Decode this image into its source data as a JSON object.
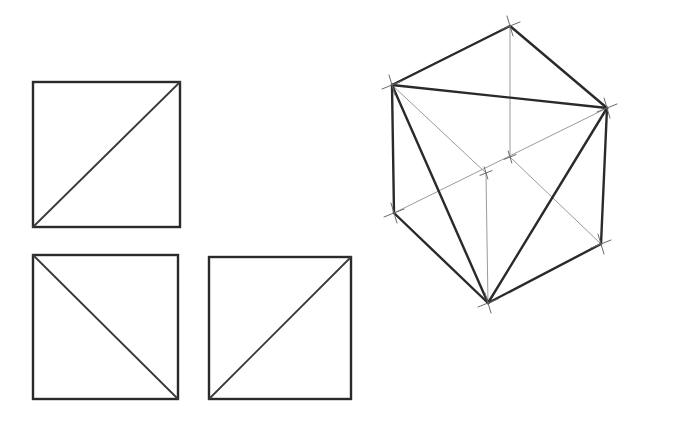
{
  "colors": {
    "background": "#ffffff",
    "heavy_line": "#2a2a2a",
    "light_line": "#9a9a9a"
  },
  "orthographic_views": [
    {
      "name": "top-view",
      "rect": {
        "x1": 33,
        "y1": 82,
        "x2": 180,
        "y2": 227
      },
      "diagonal": {
        "from": [
          33,
          227
        ],
        "to": [
          180,
          82
        ]
      }
    },
    {
      "name": "front-view",
      "rect": {
        "x1": 33,
        "y1": 255,
        "x2": 178,
        "y2": 399
      },
      "diagonal": {
        "from": [
          33,
          255
        ],
        "to": [
          178,
          399
        ]
      }
    },
    {
      "name": "side-view",
      "rect": {
        "x1": 209,
        "y1": 257,
        "x2": 351,
        "y2": 399
      },
      "diagonal": {
        "from": [
          209,
          399
        ],
        "to": [
          351,
          257
        ]
      }
    }
  ],
  "isometric_cube": {
    "vertices": {
      "top": [
        510,
        26
      ],
      "left_top": [
        392,
        85
      ],
      "right_top": [
        607,
        108
      ],
      "left_bottom": [
        394,
        213
      ],
      "right_bottom": [
        601,
        244
      ],
      "bottom": [
        488,
        303
      ],
      "hidden_back": [
        510,
        157
      ],
      "front_center": [
        486,
        173
      ]
    },
    "heavy_edges": [
      [
        "left_top",
        "top"
      ],
      [
        "top",
        "right_top"
      ],
      [
        "left_top",
        "right_top"
      ],
      [
        "left_top",
        "left_bottom"
      ],
      [
        "right_top",
        "right_bottom"
      ],
      [
        "left_bottom",
        "bottom"
      ],
      [
        "bottom",
        "right_bottom"
      ],
      [
        "left_top",
        "bottom"
      ],
      [
        "right_top",
        "bottom"
      ]
    ],
    "light_edges": [
      [
        "top",
        "hidden_back"
      ],
      [
        "left_top",
        "front_center"
      ],
      [
        "front_center",
        "bottom"
      ],
      [
        "hidden_back",
        "right_bottom"
      ],
      [
        "left_bottom",
        "right_top"
      ]
    ]
  }
}
